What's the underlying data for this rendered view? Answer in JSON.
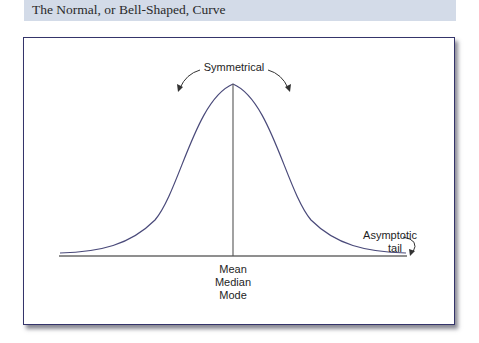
{
  "header": {
    "title": "The Normal, or Bell-Shaped, Curve"
  },
  "diagram": {
    "labels": {
      "symmetrical": "Symmetrical",
      "asymptotic_line1": "Asymptotic",
      "asymptotic_line2": "tail",
      "mean": "Mean",
      "median": "Median",
      "mode": "Mode"
    },
    "colors": {
      "curve": "#4a4a7a",
      "axis": "#555555",
      "frame_border": "#34346a",
      "header_band": "#d3dbe8"
    }
  }
}
